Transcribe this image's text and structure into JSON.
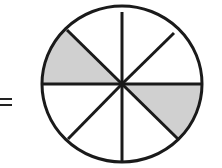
{
  "diagram": {
    "type": "fraction-circle",
    "prefix_symbol": "=",
    "total_sectors": 8,
    "shaded_sectors": 2,
    "shaded_positions": [
      "upper-left (between left horizontal and upper-left diagonal)",
      "lower-right (between right horizontal and lower-right diagonal)"
    ],
    "colors": {
      "stroke": "#1a1a1a",
      "shade": "#d0d0d0",
      "background": "#ffffff"
    }
  }
}
